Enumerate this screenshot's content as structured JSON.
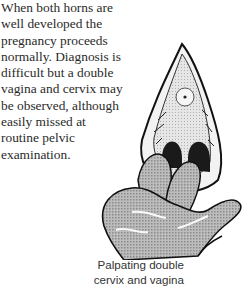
{
  "body_text": {
    "lines": [
      "When both horns are",
      "well developed the",
      "pregnancy proceeds",
      "normally. Diagnosis is",
      "difficult but a double",
      "vagina and cervix may",
      "be observed, although",
      "easily missed at",
      "routine pelvic",
      "examination."
    ]
  },
  "figure": {
    "illustration": "hand-palpating-double-cervix-illustration",
    "caption_lines": [
      "Palpating double",
      "cervix and vagina"
    ]
  }
}
